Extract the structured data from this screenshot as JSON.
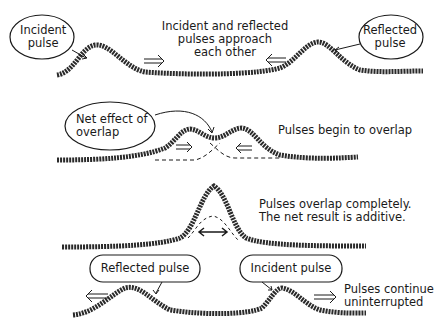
{
  "panels": [
    {
      "id": "approach",
      "caption": [
        "Incident and reflected",
        "pulses approach",
        "each other"
      ],
      "bubbles": [
        {
          "label": [
            "Incident",
            "pulse"
          ]
        },
        {
          "label": [
            "Reflected",
            "pulse"
          ]
        }
      ],
      "arrows": [
        "right-double-arrow",
        "left-double-arrow"
      ]
    },
    {
      "id": "begin-overlap",
      "caption": [
        "Pulses begin to overlap"
      ],
      "bubbles": [
        {
          "label": [
            "Net effect of",
            "overlap"
          ]
        }
      ],
      "arrows": [
        "right-double-arrow",
        "left-double-arrow"
      ]
    },
    {
      "id": "complete-overlap",
      "caption": [
        "Pulses overlap completely.",
        "The net result is additive."
      ],
      "arrows": [
        "left-right-arrow"
      ]
    },
    {
      "id": "continue",
      "caption": [
        "Pulses continue",
        "uninterrupted"
      ],
      "bubbles": [
        {
          "label": [
            "Reflected pulse"
          ]
        },
        {
          "label": [
            "Incident pulse"
          ]
        }
      ],
      "arrows": [
        "left-double-arrow",
        "right-double-arrow"
      ]
    }
  ],
  "colors": {
    "ink": "#1a1a1a",
    "background": "#ffffff"
  }
}
